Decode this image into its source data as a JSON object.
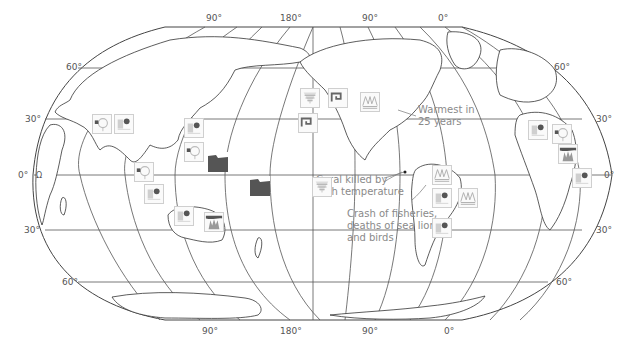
{
  "map": {
    "projection": "robinson-like",
    "colors": {
      "outline": "#444444",
      "graticule": "#555555",
      "land_fill": "#ffffff",
      "icon_border": "#cfcfcf",
      "icon_dark": "#555555",
      "icon_gray": "#8a8a8a",
      "annotation_text": "#8a8a8a"
    },
    "longitude_labels_top": [
      "90°",
      "180°",
      "90°",
      "0°"
    ],
    "longitude_labels_bottom": [
      "90°",
      "180°",
      "90°",
      "0°"
    ],
    "latitude_labels_left": [
      "60°",
      "30°",
      "0°",
      "30°",
      "60°"
    ],
    "latitude_labels_right": [
      "60°",
      "30°",
      "0°",
      "30°",
      "60°"
    ],
    "small_label": "Ω"
  },
  "annotations": {
    "warmest": "Warmest in 25 years",
    "warmest_line1": "Warmest in",
    "warmest_line2": "25 years",
    "coral_line1": "Coral killed by",
    "coral_line2": "high temperature",
    "fish_line1": "Crash of fisheries,",
    "fish_line2": "deaths of sea lions",
    "fish_line3": "and birds"
  },
  "icons": [
    {
      "type": "drought-icon",
      "x": 92,
      "y": 114
    },
    {
      "type": "rain-icon",
      "x": 114,
      "y": 114
    },
    {
      "type": "rain-icon",
      "x": 184,
      "y": 118
    },
    {
      "type": "drought-icon",
      "x": 184,
      "y": 142
    },
    {
      "type": "storm-icon",
      "x": 208,
      "y": 152
    },
    {
      "type": "drought-icon",
      "x": 134,
      "y": 162
    },
    {
      "type": "rain-icon",
      "x": 144,
      "y": 184
    },
    {
      "type": "rain-icon",
      "x": 174,
      "y": 206
    },
    {
      "type": "fire-icon",
      "x": 204,
      "y": 212
    },
    {
      "type": "storm-icon",
      "x": 250,
      "y": 176
    },
    {
      "type": "cyclone-icon",
      "x": 298,
      "y": 113
    },
    {
      "type": "coral-icon",
      "x": 300,
      "y": 88
    },
    {
      "type": "coral-icon",
      "x": 312,
      "y": 177
    },
    {
      "type": "flood-icon",
      "x": 360,
      "y": 92
    },
    {
      "type": "cyclone-icon",
      "x": 328,
      "y": 88
    },
    {
      "type": "flood-icon",
      "x": 432,
      "y": 165
    },
    {
      "type": "rain-icon",
      "x": 432,
      "y": 188
    },
    {
      "type": "flood-icon",
      "x": 458,
      "y": 188
    },
    {
      "type": "rain-icon",
      "x": 432,
      "y": 218
    },
    {
      "type": "rain-icon",
      "x": 528,
      "y": 120
    },
    {
      "type": "drought-icon",
      "x": 552,
      "y": 124
    },
    {
      "type": "fire-icon",
      "x": 558,
      "y": 144
    },
    {
      "type": "rain-icon",
      "x": 572,
      "y": 168
    }
  ]
}
